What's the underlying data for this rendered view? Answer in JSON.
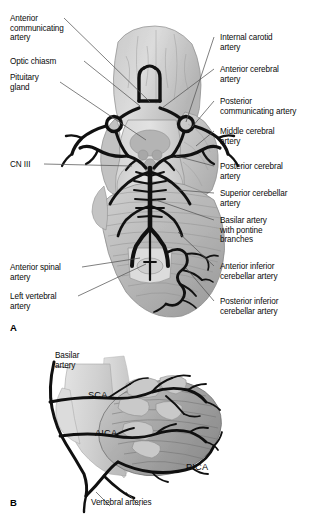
{
  "figure": {
    "background_color": "#ffffff",
    "artery_color": "#111111",
    "brain_fill_light": "#d8d8d8",
    "brain_fill_mid": "#bdbdbd",
    "brain_fill_dark": "#8f8f8f",
    "leader_color": "#4a4a4a"
  },
  "panel_a": {
    "letter": "A",
    "labels_left": [
      {
        "id": "anterior-communicating-artery",
        "text": "Anterior\ncommunicating\nartery",
        "x": 10,
        "y": 14
      },
      {
        "id": "optic-chiasm",
        "text": "Optic chiasm",
        "x": 10,
        "y": 57
      },
      {
        "id": "pituitary-gland",
        "text": "Pituitary\ngland",
        "x": 10,
        "y": 73
      },
      {
        "id": "cn-iii",
        "text": "CN III",
        "x": 10,
        "y": 160
      },
      {
        "id": "anterior-spinal-artery",
        "text": "Anterior spinal\nartery",
        "x": 10,
        "y": 263
      },
      {
        "id": "left-vertebral-artery",
        "text": "Left vertebral\nartery",
        "x": 10,
        "y": 292
      }
    ],
    "labels_right": [
      {
        "id": "internal-carotid-artery",
        "text": "Internal carotid\nartery",
        "x": 218,
        "y": 33
      },
      {
        "id": "anterior-cerebral-artery",
        "text": "Anterior cerebral\nartery",
        "x": 218,
        "y": 65
      },
      {
        "id": "posterior-communicating-artery",
        "text": "Posterior\ncommunicating artery",
        "x": 218,
        "y": 97
      },
      {
        "id": "middle-cerebral-artery",
        "text": "Middle cerebral\nartery",
        "x": 218,
        "y": 127
      },
      {
        "id": "posterior-cerebral-artery",
        "text": "Posterior cerebral\nartery",
        "x": 218,
        "y": 162
      },
      {
        "id": "superior-cerebellar-artery",
        "text": "Superior cerebellar\nartery",
        "x": 218,
        "y": 189
      },
      {
        "id": "basilar-artery-with-pontine-branches",
        "text": "Basilar artery\nwith pontine\nbranches",
        "x": 218,
        "y": 216
      },
      {
        "id": "anterior-inferior-cerebellar-artery",
        "text": "Anterior inferior\ncerebellar artery",
        "x": 218,
        "y": 262
      },
      {
        "id": "posterior-inferior-cerebellar-artery",
        "text": "Posterior inferior\ncerebellar artery",
        "x": 218,
        "y": 297
      }
    ]
  },
  "panel_b": {
    "letter": "B",
    "labels": [
      {
        "id": "basilar-artery",
        "text": "Basilar\nartery",
        "x": 55,
        "y": 11
      },
      {
        "id": "sca",
        "text": "SCA",
        "x": 88,
        "y": 56
      },
      {
        "id": "aica",
        "text": "AICA",
        "x": 95,
        "y": 94
      },
      {
        "id": "pica",
        "text": "PICA",
        "x": 186,
        "y": 128
      },
      {
        "id": "vertebral-arteries",
        "text": "Vertebral arteries",
        "x": 91,
        "y": 158
      }
    ]
  }
}
